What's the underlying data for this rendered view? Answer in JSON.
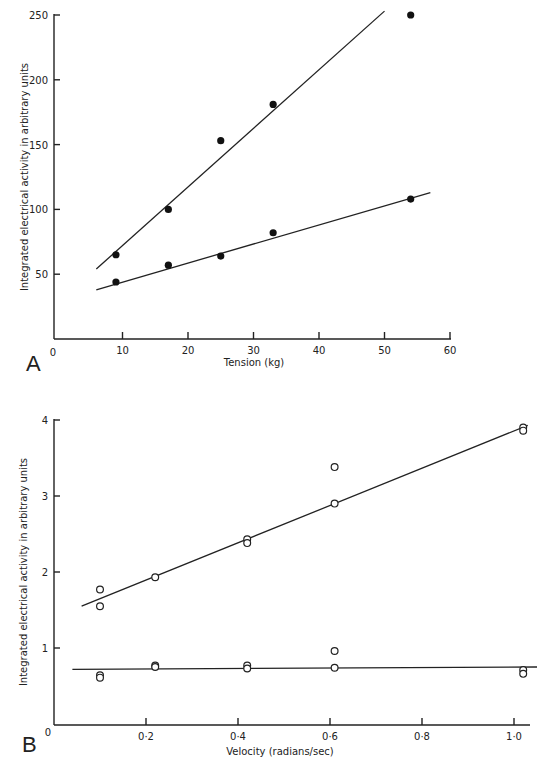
{
  "chart_data": [
    {
      "panel": "A",
      "type": "scatter",
      "title": "",
      "xlabel": "Tension (kg)",
      "ylabel": "Integrated electrical activity in arbitrary units",
      "xlim": [
        0,
        60
      ],
      "ylim": [
        0,
        250
      ],
      "x_ticks": [
        "0",
        "10",
        "20",
        "30",
        "40",
        "50",
        "60"
      ],
      "y_ticks": [
        "50",
        "100",
        "150",
        "200",
        "250"
      ],
      "grid": false,
      "marker": "filled-circle",
      "series": [
        {
          "name": "upper",
          "points": [
            [
              9,
              65
            ],
            [
              17,
              100
            ],
            [
              25,
              153
            ],
            [
              33,
              181
            ],
            [
              54,
              250
            ]
          ],
          "fit_line": [
            [
              6,
              54
            ],
            [
              50,
              253
            ]
          ]
        },
        {
          "name": "lower",
          "points": [
            [
              9,
              44
            ],
            [
              17,
              57
            ],
            [
              25,
              64
            ],
            [
              33,
              82
            ],
            [
              54,
              108
            ]
          ],
          "fit_line": [
            [
              6,
              38
            ],
            [
              57,
              113
            ]
          ]
        }
      ]
    },
    {
      "panel": "B",
      "type": "scatter",
      "title": "",
      "xlabel": "Velocity (radians/sec)",
      "ylabel": "Integrated electrical activity in arbitrary units",
      "xlim": [
        0,
        1.0
      ],
      "ylim": [
        0,
        4
      ],
      "x_ticks": [
        "0",
        "0·2",
        "0·4",
        "0·6",
        "0·8",
        "1·0"
      ],
      "y_ticks": [
        "1",
        "2",
        "3",
        "4"
      ],
      "grid": false,
      "marker": "open-circle",
      "series": [
        {
          "name": "upper",
          "points": [
            [
              0.1,
              1.77
            ],
            [
              0.1,
              1.55
            ],
            [
              0.22,
              1.93
            ],
            [
              0.42,
              2.43
            ],
            [
              0.42,
              2.38
            ],
            [
              0.61,
              3.38
            ],
            [
              0.61,
              2.9
            ],
            [
              1.02,
              3.9
            ],
            [
              1.02,
              3.86
            ]
          ],
          "fit_line": [
            [
              0.06,
              1.55
            ],
            [
              1.03,
              3.93
            ]
          ]
        },
        {
          "name": "lower",
          "points": [
            [
              0.1,
              0.64
            ],
            [
              0.1,
              0.61
            ],
            [
              0.22,
              0.77
            ],
            [
              0.22,
              0.75
            ],
            [
              0.42,
              0.77
            ],
            [
              0.42,
              0.73
            ],
            [
              0.61,
              0.96
            ],
            [
              0.61,
              0.74
            ],
            [
              1.02,
              0.71
            ],
            [
              1.02,
              0.66
            ]
          ],
          "fit_line": [
            [
              0.04,
              0.72
            ],
            [
              1.05,
              0.75
            ]
          ]
        }
      ]
    }
  ],
  "panels": {
    "A": {
      "label": "A",
      "xlabel": "Tension (kg)",
      "ylabel": "Integrated electrical activity in arbitrary units",
      "x_origin": "0",
      "x_ticks": [
        "10",
        "20",
        "30",
        "40",
        "50",
        "60"
      ],
      "y_ticks": [
        "50",
        "100",
        "150",
        "200",
        "250"
      ]
    },
    "B": {
      "label": "B",
      "xlabel": "Velocity (radians/sec)",
      "ylabel": "Integrated electrical activity in arbitrary units",
      "x_origin": "0",
      "x_ticks": [
        "0·2",
        "0·4",
        "0·6",
        "0·8",
        "1·0"
      ],
      "y_ticks": [
        "1",
        "2",
        "3",
        "4"
      ]
    }
  }
}
